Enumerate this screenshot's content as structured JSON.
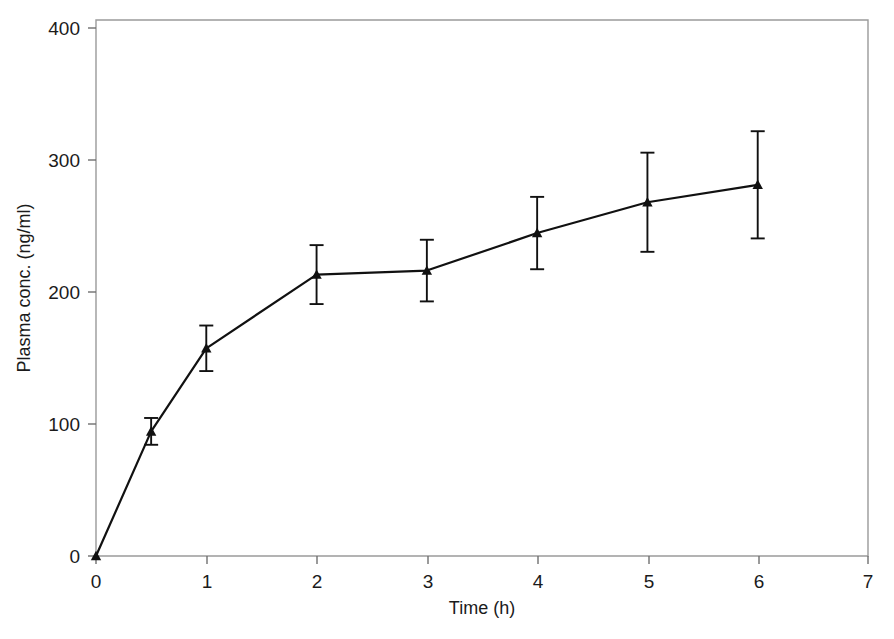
{
  "chart_data": {
    "type": "line",
    "title": "",
    "subtitle": "",
    "xlabel": "Time (h)",
    "ylabel": "Plasma conc. (ng/ml)",
    "xlim": [
      0,
      7
    ],
    "ylim": [
      0,
      400
    ],
    "xticks": [
      "0",
      "1",
      "2",
      "3",
      "4",
      "5",
      "6",
      "7"
    ],
    "xtick_values": [
      0,
      1,
      2,
      3,
      4,
      5,
      6,
      7
    ],
    "yticks": [
      "0",
      "100",
      "200",
      "300",
      "400"
    ],
    "ytick_values": [
      0,
      100,
      200,
      300,
      400
    ],
    "grid": false,
    "legend": false,
    "legend_position": "none",
    "marker": "triangle",
    "error_bars": "symmetric",
    "line_color": "#111111",
    "marker_color": "#111111",
    "frame_color": "#9a9a9a",
    "background_color": "#ffffff",
    "x": [
      0,
      0.5,
      1,
      2,
      3,
      4,
      5,
      6
    ],
    "values": [
      0,
      93,
      155,
      210,
      213,
      241,
      264,
      277
    ],
    "errors": [
      0,
      10,
      17,
      22,
      23,
      27,
      37,
      40
    ],
    "series": [
      {
        "name": "Plasma concentration",
        "x": [
          0,
          0.5,
          1,
          2,
          3,
          4,
          5,
          6
        ],
        "values": [
          0,
          93,
          155,
          210,
          213,
          241,
          264,
          277
        ],
        "errors": [
          0,
          10,
          17,
          22,
          23,
          27,
          37,
          40
        ]
      }
    ],
    "annotations": []
  },
  "axes": {
    "x_title": "Time (h)",
    "y_title": "Plasma conc. (ng/ml)"
  }
}
